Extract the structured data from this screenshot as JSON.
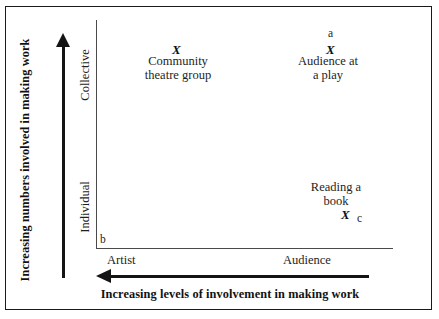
{
  "figure": {
    "type": "scatter-quadrant-diagram",
    "y_axis": {
      "caption": "Increasing numbers involved in making work",
      "tiers": [
        "Collective",
        "Individual"
      ],
      "arrow_direction": "up"
    },
    "x_axis": {
      "caption": "Increasing levels of involvement in making work",
      "categories": [
        "Artist",
        "Audience"
      ],
      "arrow_direction": "left"
    },
    "origin_key": "b",
    "points": [
      {
        "key": "",
        "marker": "X",
        "label": "Community\ntheatre group",
        "x_position": "Artist",
        "y_position": "Collective"
      },
      {
        "key": "a",
        "marker": "X",
        "label": "Audience at\na play",
        "x_position": "Audience",
        "y_position": "Collective"
      },
      {
        "key": "c",
        "marker": "X",
        "label": "Reading a\nbook",
        "x_position": "Audience",
        "y_position": "Individual"
      }
    ],
    "colors": {
      "ink": "#1d1d1d",
      "axis": "#4a4a4a",
      "arrow": "#141414",
      "frame": "#1a1a1a",
      "background": "#ffffff"
    }
  },
  "chart_data": {
    "type": "scatter",
    "title": "",
    "xlabel": "Increasing levels of involvement in making work",
    "ylabel": "Increasing numbers involved in making work",
    "x_ticklabels": [
      "Artist",
      "Audience"
    ],
    "y_ticklabels": [
      "Individual",
      "Collective"
    ],
    "grid": false,
    "legend": "none",
    "annotations": [
      "a",
      "b",
      "c"
    ],
    "points": [
      {
        "label": "Community theatre group",
        "x": "Artist",
        "y": "Collective",
        "key": ""
      },
      {
        "label": "Audience at a play",
        "x": "Audience",
        "y": "Collective",
        "key": "a"
      },
      {
        "label": "Reading a book",
        "x": "Audience",
        "y": "Individual",
        "key": "c"
      }
    ]
  }
}
